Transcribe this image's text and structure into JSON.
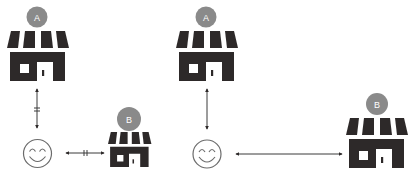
{
  "diagram": {
    "type": "store-distance-comparison",
    "colors": {
      "store": "#2d2929",
      "badge": "#8a8a8a",
      "badge_text": "#ffffff",
      "line": "#3a3a3a",
      "face": "#6b6b6b",
      "background": "#ffffff"
    },
    "panels": [
      {
        "id": "left",
        "store_a": {
          "label": "A"
        },
        "store_b": {
          "label": "B"
        },
        "customer": {
          "icon": "smiley-face-icon"
        },
        "link_a": {
          "direction": "vertical",
          "bidirectional": true,
          "break_mark": true
        },
        "link_b": {
          "direction": "horizontal",
          "bidirectional": true,
          "break_mark": true
        }
      },
      {
        "id": "right",
        "store_a": {
          "label": "A"
        },
        "store_b": {
          "label": "B"
        },
        "customer": {
          "icon": "smiley-face-icon"
        },
        "link_a": {
          "direction": "vertical",
          "bidirectional": true,
          "break_mark": false
        },
        "link_b": {
          "direction": "horizontal",
          "bidirectional": true,
          "break_mark": false
        }
      }
    ]
  }
}
